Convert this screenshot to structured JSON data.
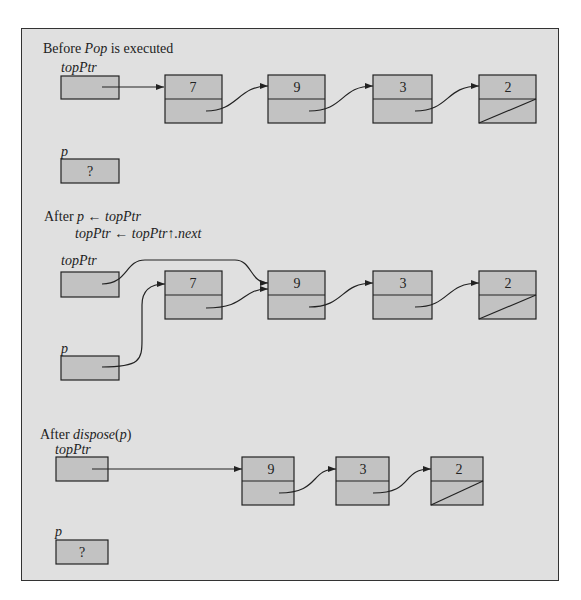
{
  "panels": [
    {
      "title_prefix": "Before ",
      "title_italic": "Pop",
      "title_suffix": " is executed",
      "top_label": "topPtr",
      "p_label": "p",
      "p_value": "?",
      "nodes": [
        "7",
        "9",
        "3",
        "2"
      ]
    },
    {
      "title_prefix": "After ",
      "line1_p": "p",
      "line1_arrow": " ← ",
      "line1_rhs": "topPtr",
      "line2_lhs": "topPtr",
      "line2_arrow": " ← ",
      "line2_rhs": "topPtr↑.next",
      "top_label": "topPtr",
      "p_label": "p",
      "nodes": [
        "7",
        "9",
        "3",
        "2"
      ]
    },
    {
      "title_prefix": "After ",
      "title_italic": "dispose",
      "title_suffix": "(",
      "title_arg": "p",
      "title_close": ")",
      "top_label": "topPtr",
      "p_label": "p",
      "p_value": "?",
      "nodes": [
        "9",
        "3",
        "2"
      ]
    }
  ],
  "colors": {
    "panel_bg": "#e0e0e0",
    "box_fill": "#c2c2c2",
    "stroke": "#222222"
  }
}
